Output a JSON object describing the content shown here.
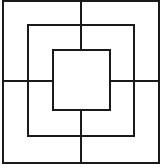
{
  "diagram": {
    "type": "nine-mens-morris-board",
    "background": "#ffffff",
    "stroke_color": "#1a1a1a",
    "stroke_width": 2,
    "squares": [
      {
        "name": "outer",
        "x": 3,
        "y": 1,
        "w": 156,
        "h": 162
      },
      {
        "name": "middle",
        "x": 28,
        "y": 25,
        "w": 106,
        "h": 111
      },
      {
        "name": "inner",
        "x": 53,
        "y": 50,
        "w": 57,
        "h": 60
      }
    ],
    "connectors": [
      {
        "name": "top",
        "x1": 81,
        "y1": 1,
        "x2": 81,
        "y2": 50
      },
      {
        "name": "bottom",
        "x1": 81,
        "y1": 110,
        "x2": 81,
        "y2": 163
      },
      {
        "name": "left",
        "x1": 3,
        "y1": 81,
        "x2": 53,
        "y2": 81
      },
      {
        "name": "right",
        "x1": 110,
        "y1": 81,
        "x2": 159,
        "y2": 81
      }
    ]
  }
}
